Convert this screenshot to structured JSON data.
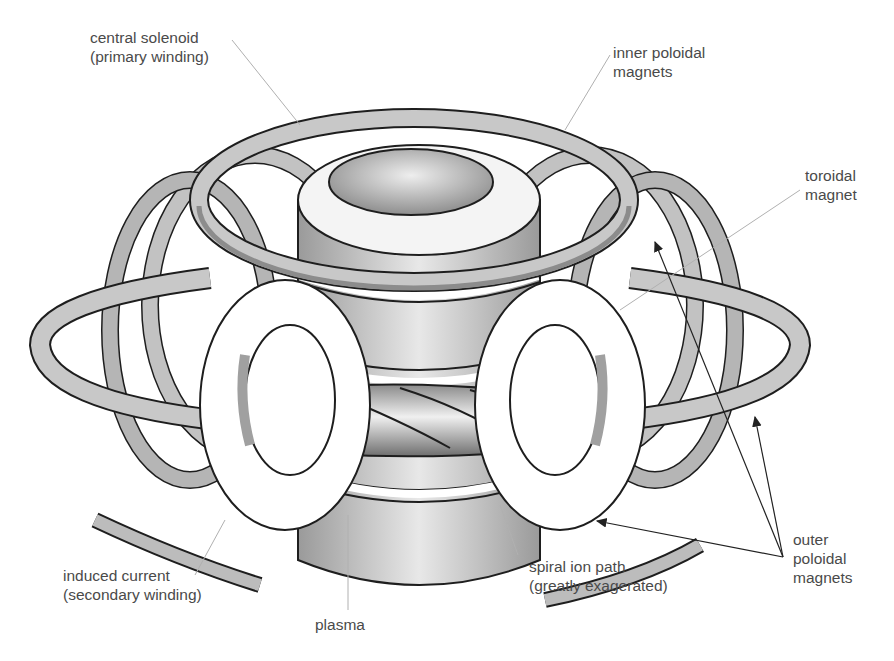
{
  "diagram": {
    "colors": {
      "background": "#ffffff",
      "magnet_face": "#c8c8c8",
      "magnet_side": "#8c8c8c",
      "solenoid": "#bdbdbd",
      "outline": "#1e1e1e",
      "label_text": "#4a4a4a",
      "leader_line": "#b0b0b0",
      "arrow": "#222222"
    },
    "labels": {
      "central_solenoid": {
        "line1": "central solenoid",
        "line2": "(primary winding)"
      },
      "inner_poloidal": {
        "line1": "inner poloidal",
        "line2": "magnets"
      },
      "toroidal": {
        "line1": "toroidal",
        "line2": "magnet"
      },
      "induced_current": {
        "line1": "induced current",
        "line2": "(secondary winding)"
      },
      "plasma": {
        "line1": "plasma"
      },
      "spiral_ion_path": {
        "line1": "spiral ion path",
        "line2": "(greatly exagerated)"
      },
      "outer_poloidal": {
        "line1": "outer",
        "line2": "poloidal",
        "line3": "magnets"
      }
    },
    "components": [
      "central-solenoid",
      "inner-poloidal-magnet-ring",
      "outer-poloidal-magnet-rings",
      "toroidal-field-coils",
      "plasma-torus",
      "spiral-ion-path",
      "induced-current-arrows"
    ]
  }
}
